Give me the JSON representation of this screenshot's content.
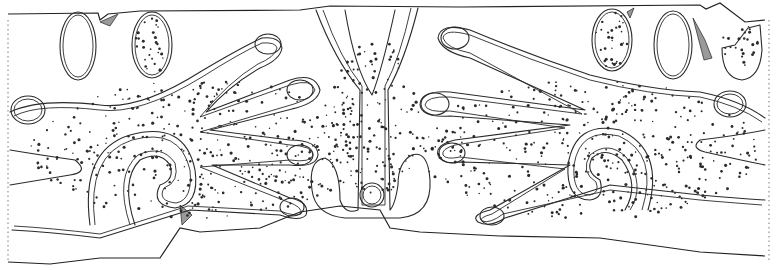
{
  "figure": {
    "colors": {
      "line": "#2a2a2a",
      "stipple": "#2b2b2b",
      "background": "#ffffff",
      "hatch": "#9a9a9a"
    }
  },
  "stipple_regions": [
    {
      "name": "left-hand",
      "cx": 200,
      "cy": 150,
      "rx": 170,
      "ry": 70,
      "count": 420
    },
    {
      "name": "right-hand",
      "cx": 590,
      "cy": 150,
      "rx": 170,
      "ry": 70,
      "count": 420
    },
    {
      "name": "center-y",
      "cx": 375,
      "cy": 120,
      "rx": 45,
      "ry": 80,
      "count": 150
    },
    {
      "name": "oval-2",
      "cx": 152,
      "cy": 45,
      "rx": 17,
      "ry": 30,
      "count": 30
    },
    {
      "name": "oval-4",
      "cx": 612,
      "cy": 40,
      "rx": 18,
      "ry": 28,
      "count": 30
    },
    {
      "name": "oval-6",
      "cx": 740,
      "cy": 45,
      "rx": 18,
      "ry": 25,
      "count": 25
    }
  ]
}
